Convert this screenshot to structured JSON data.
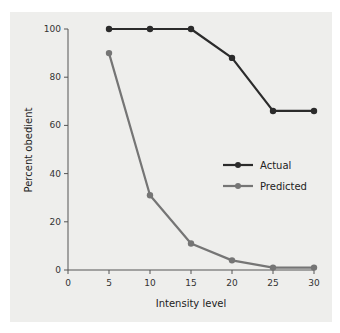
{
  "chart_data": {
    "type": "line",
    "title": "",
    "xlabel": "Intensity level",
    "ylabel": "Percent obedient",
    "x": [
      5,
      10,
      15,
      20,
      25,
      30
    ],
    "xticks": [
      0,
      5,
      10,
      15,
      20,
      25,
      30
    ],
    "yticks": [
      0,
      20,
      40,
      60,
      80,
      100
    ],
    "xlim": [
      0,
      30
    ],
    "ylim": [
      0,
      100
    ],
    "grid": false,
    "legend_position": "right-middle",
    "series": [
      {
        "name": "Actual",
        "color": "#2b2b2b",
        "values": [
          100,
          100,
          100,
          88,
          66,
          66
        ]
      },
      {
        "name": "Predicted",
        "color": "#757575",
        "values": [
          90,
          31,
          11,
          4,
          1,
          1
        ]
      }
    ]
  },
  "legend": {
    "actual_label": "Actual",
    "predicted_label": "Predicted"
  },
  "colors": {
    "background": "#eeeeec",
    "axis": "#555555"
  }
}
